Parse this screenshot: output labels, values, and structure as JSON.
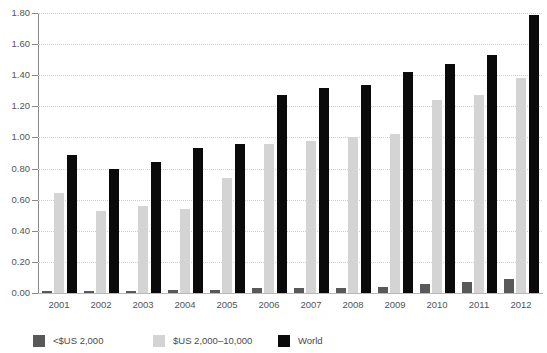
{
  "chart_data": {
    "type": "bar",
    "title": "",
    "subtitle": "",
    "xlabel": "",
    "ylabel": "",
    "categories": [
      "2001",
      "2002",
      "2003",
      "2004",
      "2005",
      "2006",
      "2007",
      "2008",
      "2009",
      "2010",
      "2011",
      "2012"
    ],
    "series": [
      {
        "name": "<$US 2,000",
        "color": "#595959",
        "values": [
          0.01,
          0.01,
          0.01,
          0.02,
          0.02,
          0.03,
          0.03,
          0.03,
          0.04,
          0.06,
          0.07,
          0.09
        ]
      },
      {
        "name": "$US 2,000–10,000",
        "color": "#d4d4d4",
        "values": [
          0.64,
          0.53,
          0.56,
          0.54,
          0.74,
          0.96,
          0.98,
          1.0,
          1.02,
          1.24,
          1.27,
          1.38
        ]
      },
      {
        "name": "World",
        "color": "#0a0a0a",
        "values": [
          0.89,
          0.8,
          0.84,
          0.93,
          0.96,
          1.27,
          1.32,
          1.34,
          1.42,
          1.47,
          1.53,
          1.79
        ]
      }
    ],
    "ylim": [
      0.0,
      1.8
    ],
    "y_ticks": [
      "0.00",
      "0.20",
      "0.40",
      "0.60",
      "0.80",
      "1.00",
      "1.20",
      "1.40",
      "1.60",
      "1.80"
    ],
    "y_tick_values": [
      0.0,
      0.2,
      0.4,
      0.6,
      0.8,
      1.0,
      1.2,
      1.4,
      1.6,
      1.8
    ],
    "grid": true,
    "legend_position": "bottom-left",
    "background_color": "#ffffff",
    "grid_color": "#cfcfcf",
    "axis_color": "#8a8a8a",
    "tick_label_color": "#555555"
  },
  "legend": {
    "items": [
      {
        "label": "<$US 2,000",
        "color": "#595959"
      },
      {
        "label": "$US 2,000–10,000",
        "color": "#d4d4d4"
      },
      {
        "label": "World",
        "color": "#0a0a0a"
      }
    ]
  }
}
